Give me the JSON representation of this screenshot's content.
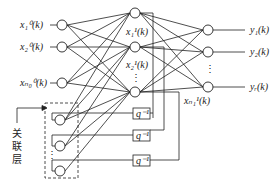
{
  "diagram": {
    "type": "Elman recurrent neural network",
    "input_labels": [
      "x₁⁰(k)",
      "x₂⁰(k)",
      "xₙ₀⁰(k)"
    ],
    "hidden_labels": [
      "x₁¹(k)",
      "x₂¹(k)",
      "xₙ₁¹(k)"
    ],
    "output_labels": [
      "y₁(k)",
      "y₂(k)",
      "yᵣ(k)"
    ],
    "delay_label": "q⁻¹",
    "context_layer_label": [
      "关",
      "联",
      "层"
    ],
    "ellipsis": "⋮",
    "colors": {
      "line": "#222222",
      "background": "#ffffff"
    }
  }
}
